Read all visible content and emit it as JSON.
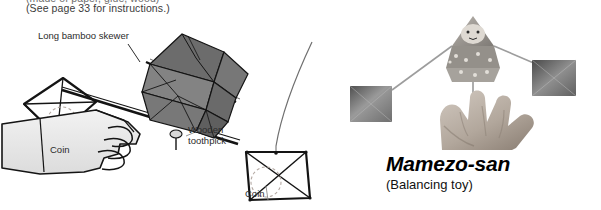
{
  "page": {
    "width": 601,
    "height": 210,
    "background": "#ffffff"
  },
  "header": {
    "clipped_line": "(made of paper, glue, wood)",
    "instructions_note": "(See page 33 for instructions.)"
  },
  "diagram": {
    "caption_labels": [
      {
        "id": "skewer",
        "text": "Long bamboo skewer"
      },
      {
        "id": "toothpick",
        "text": "Wooden toothpick"
      },
      {
        "id": "coin-left",
        "text": "Coin"
      },
      {
        "id": "coin-right",
        "text": "Coin"
      }
    ],
    "elements": {
      "skewer_label": "Long bamboo skewer",
      "toothpick_label": "Wooden toothpick",
      "coin_left_label": "Coin",
      "coin_right_label": "Coin"
    },
    "colors": {
      "ink": "#141414",
      "origami_fill_dark": "#6d6d6d",
      "origami_fill_mid": "#7e7e7e",
      "origami_fill_light": "#8e8e8e",
      "hand_fill": "#e6e6e6",
      "dashed_coin": "#b4a9a3"
    }
  },
  "photo": {
    "subject": "hand balancing origami doll with two weighted flags",
    "colors": {
      "flag_dark": "#5a5a5a",
      "flag_mid": "#8a8a8a",
      "flag_light": "#b5b5b5",
      "skin_light": "#d8d0c8",
      "skin_mid": "#b8ada3",
      "skin_shadow": "#8d8176",
      "rod": "#9a9a9a"
    }
  },
  "title": {
    "main": "Mamezo-san",
    "subtitle": "(Balancing toy)"
  }
}
